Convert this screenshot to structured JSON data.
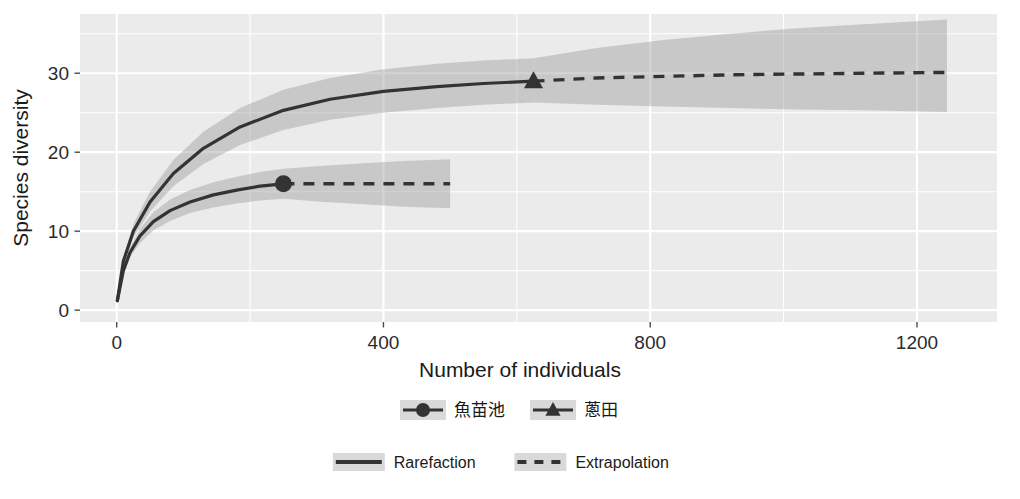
{
  "chart_data": {
    "type": "line",
    "title": "",
    "xlabel": "Number of individuals",
    "ylabel": "Species diversity",
    "xlim": [
      -55,
      1320
    ],
    "ylim": [
      -1.5,
      37.5
    ],
    "xticks": [
      0,
      400,
      800,
      1200
    ],
    "yticks": [
      0,
      10,
      20,
      30
    ],
    "xtick_labels": [
      "0",
      "400",
      "800",
      "1200"
    ],
    "ytick_labels": [
      "0",
      "10",
      "20",
      "30"
    ],
    "grid": true,
    "panel_background": "#ebebeb",
    "grid_color": "#ffffff",
    "line_color": "#333333",
    "ribbon_color": "#999999",
    "legend_position": "bottom",
    "series": [
      {
        "name": "魚苗池",
        "marker": "circle",
        "reference_point": {
          "x": 250,
          "y": 16.0
        },
        "rarefaction": {
          "x": [
            1,
            10,
            20,
            35,
            55,
            80,
            110,
            145,
            180,
            215,
            250
          ],
          "y": [
            1.2,
            5.0,
            7.3,
            9.4,
            11.2,
            12.6,
            13.7,
            14.6,
            15.2,
            15.7,
            16.0
          ]
        },
        "extrapolation": {
          "x": [
            250,
            310,
            370,
            430,
            500
          ],
          "y": [
            16.0,
            16.0,
            16.0,
            16.0,
            16.0
          ]
        },
        "ribbon_rarefaction": {
          "x": [
            1,
            10,
            20,
            35,
            55,
            80,
            110,
            145,
            180,
            215,
            250
          ],
          "lower": [
            1.2,
            4.7,
            6.7,
            8.5,
            10.1,
            11.3,
            12.3,
            13.0,
            13.5,
            13.9,
            14.1
          ],
          "upper": [
            1.2,
            5.3,
            7.9,
            10.3,
            12.4,
            14.0,
            15.2,
            16.2,
            16.9,
            17.5,
            17.9
          ]
        },
        "ribbon_extrapolation": {
          "x": [
            250,
            310,
            370,
            430,
            500
          ],
          "lower": [
            14.1,
            13.7,
            13.4,
            13.1,
            12.9
          ],
          "upper": [
            17.9,
            18.3,
            18.6,
            18.9,
            19.1
          ]
        }
      },
      {
        "name": "蔥田",
        "marker": "triangle",
        "reference_point": {
          "x": 625,
          "y": 29.0
        },
        "rarefaction": {
          "x": [
            1,
            10,
            25,
            50,
            85,
            130,
            185,
            250,
            320,
            400,
            480,
            550,
            625
          ],
          "y": [
            1.2,
            6.2,
            10.0,
            13.7,
            17.3,
            20.5,
            23.2,
            25.3,
            26.7,
            27.7,
            28.3,
            28.7,
            29.0
          ]
        },
        "extrapolation": {
          "x": [
            625,
            720,
            820,
            920,
            1020,
            1120,
            1245
          ],
          "y": [
            29.0,
            29.4,
            29.6,
            29.8,
            29.9,
            30.0,
            30.1
          ]
        },
        "ribbon_rarefaction": {
          "x": [
            1,
            10,
            25,
            50,
            85,
            130,
            185,
            250,
            320,
            400,
            480,
            550,
            625
          ],
          "lower": [
            1.2,
            5.8,
            9.2,
            12.5,
            15.7,
            18.5,
            20.9,
            22.8,
            24.1,
            25.0,
            25.6,
            26.0,
            26.3
          ],
          "upper": [
            1.2,
            6.6,
            10.9,
            15.0,
            19.0,
            22.6,
            25.6,
            27.9,
            29.4,
            30.5,
            31.2,
            31.6,
            31.9
          ]
        },
        "ribbon_extrapolation": {
          "x": [
            625,
            720,
            820,
            920,
            1020,
            1120,
            1245
          ],
          "lower": [
            26.3,
            26.0,
            25.8,
            25.6,
            25.4,
            25.3,
            25.1
          ],
          "upper": [
            31.9,
            33.2,
            34.2,
            35.0,
            35.7,
            36.2,
            36.8
          ]
        }
      }
    ],
    "legends": [
      {
        "name": "site-legend",
        "entries": [
          {
            "label": "魚苗池",
            "marker": "circle"
          },
          {
            "label": "蔥田",
            "marker": "triangle"
          }
        ]
      },
      {
        "name": "method-legend",
        "entries": [
          {
            "label": "Rarefaction",
            "style": "solid"
          },
          {
            "label": "Extrapolation",
            "style": "dashed"
          }
        ]
      }
    ]
  }
}
